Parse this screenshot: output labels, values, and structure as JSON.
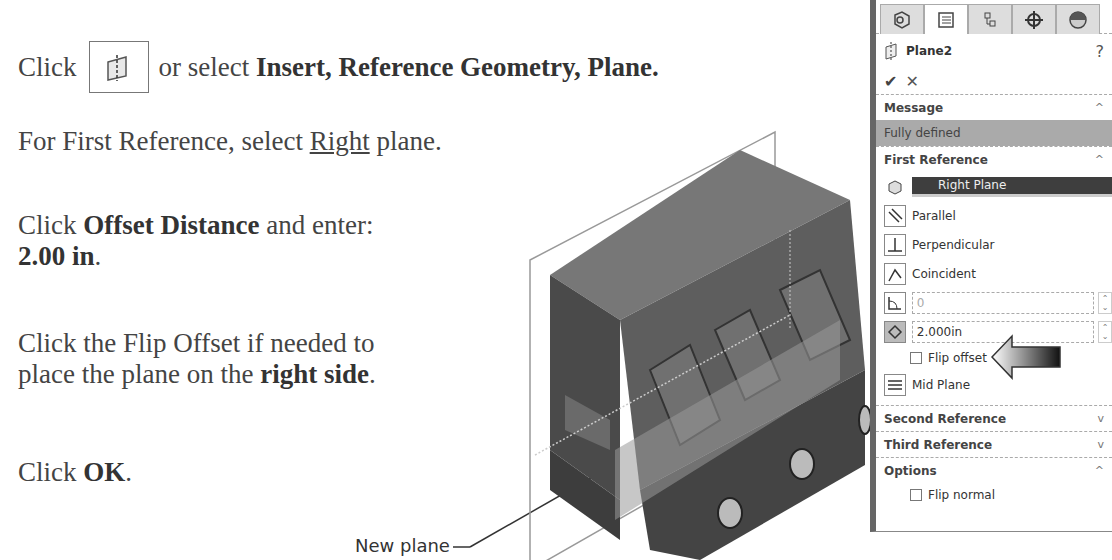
{
  "instructions": {
    "step1": {
      "prefix": "Click",
      "middle": "or select",
      "bold": "Insert, Reference Geometry, Plane."
    },
    "step2": {
      "prefix": "For First Reference, select",
      "underlined": "Right",
      "suffix": "plane."
    },
    "step3": {
      "prefix": "Click",
      "bold": "Offset Distance",
      "suffix": "and enter:",
      "value_bold": "2.00 in",
      "end": "."
    },
    "step4": {
      "line1": "Click the Flip Offset if needed to",
      "line2_prefix": "place the plane on the",
      "bold": "right side",
      "end": "."
    },
    "step5": {
      "prefix": "Click",
      "bold": "OK",
      "end": "."
    }
  },
  "caption": "New plane",
  "panel": {
    "tabs": [
      "feature-manager",
      "property-manager",
      "configuration-manager",
      "dimxpert-manager",
      "display-manager"
    ],
    "title": "Plane2",
    "help": "?",
    "ok": "✔",
    "cancel": "✕",
    "message": {
      "header": "Message",
      "text": "Fully defined"
    },
    "first_reference": {
      "header": "First Reference",
      "selection": "Right Plane",
      "options": [
        "Parallel",
        "Perpendicular",
        "Coincident"
      ],
      "angle_value": "0",
      "distance_value": "2.000in",
      "flip_offset": "Flip offset",
      "mid_plane": "Mid Plane"
    },
    "second_reference": "Second Reference",
    "third_reference": "Third Reference",
    "options": {
      "header": "Options",
      "flip_normal": "Flip normal"
    }
  }
}
